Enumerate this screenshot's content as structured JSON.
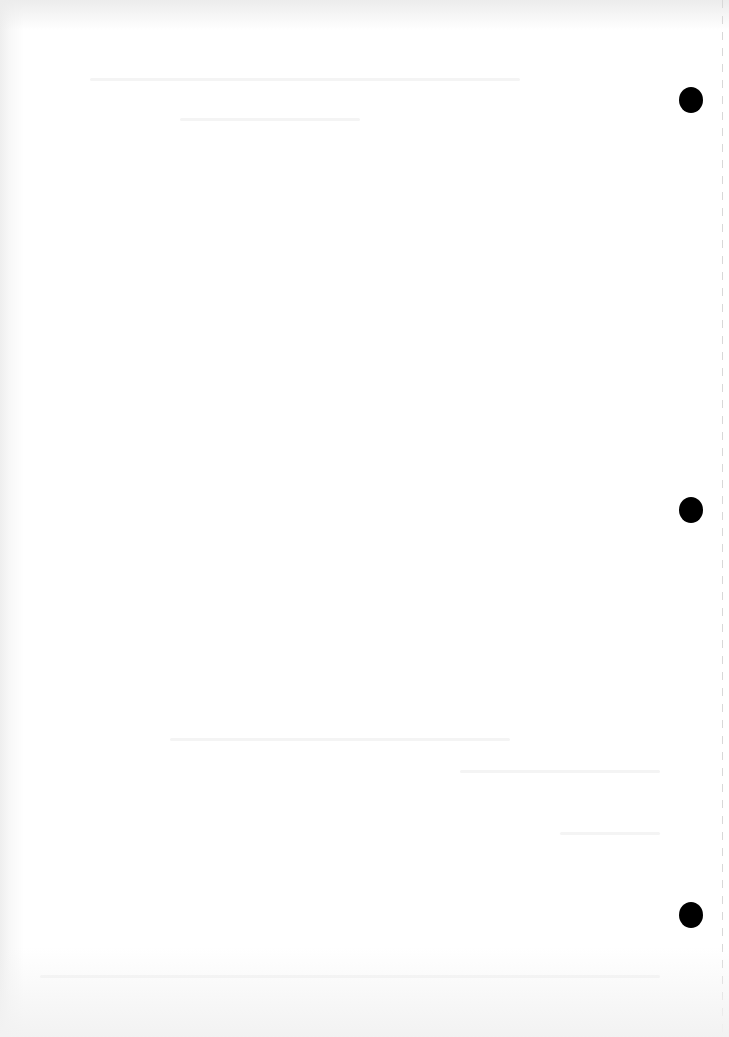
{
  "document": {
    "type": "blank scanned page",
    "visible_text": "",
    "punch_holes": [
      {
        "x": 679,
        "y": 87
      },
      {
        "x": 679,
        "y": 497
      },
      {
        "x": 679,
        "y": 902
      }
    ],
    "colors": {
      "paper": "#ffffff",
      "hole": "#000000",
      "edge_shadow": "#eeeeee",
      "perforation": "#d8d8d8"
    }
  }
}
